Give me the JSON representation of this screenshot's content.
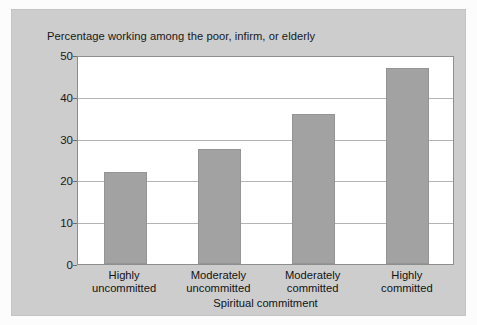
{
  "chart_data": {
    "type": "bar",
    "title": "Percentage working among the poor, infirm, or elderly",
    "categories": [
      "Highly uncommitted",
      "Moderately uncommitted",
      "Moderately committed",
      "Highly committed"
    ],
    "category_lines": [
      [
        "Highly",
        "uncommitted"
      ],
      [
        "Moderately",
        "uncommitted"
      ],
      [
        "Moderately",
        "committed"
      ],
      [
        "Highly",
        "committed"
      ]
    ],
    "values": [
      22,
      27.5,
      36,
      47
    ],
    "xlabel": "Spiritual commitment",
    "ylabel": "",
    "ylim": [
      0,
      50
    ],
    "yticks": [
      0,
      10,
      20,
      30,
      40,
      50
    ],
    "ytick_labels": [
      "0",
      "10",
      "20",
      "30",
      "40",
      "50"
    ],
    "grid": true,
    "legend": false,
    "bar_color": "#a2a2a2",
    "plot_background": "#ffffff",
    "panel_background": "#cdcdcd"
  }
}
